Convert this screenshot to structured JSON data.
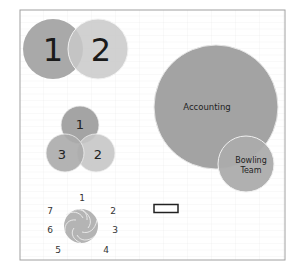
{
  "venn_two": {
    "labels": [
      "1",
      "2"
    ],
    "colors": [
      "#a9a9a9",
      "#c9c9c9"
    ]
  },
  "venn_three": {
    "labels": [
      "1",
      "2",
      "3"
    ],
    "colors": [
      "#a4a4a4",
      "#c6c6c6",
      "#ababab"
    ]
  },
  "nested_venn": {
    "outer_label": "Accounting",
    "inner_label_line1": "Bowling",
    "inner_label_line2": "Team",
    "outer_color": "#a3a3a3",
    "inner_color": "#acacac"
  },
  "radial_diagram": {
    "labels": [
      "1",
      "2",
      "3",
      "4",
      "5",
      "6",
      "7"
    ],
    "color": "#b4b4b4"
  },
  "selection_box": {
    "border_color": "#222222"
  },
  "frame": {
    "border_color": "#a0a0a0",
    "grid_color": "#ececec"
  }
}
